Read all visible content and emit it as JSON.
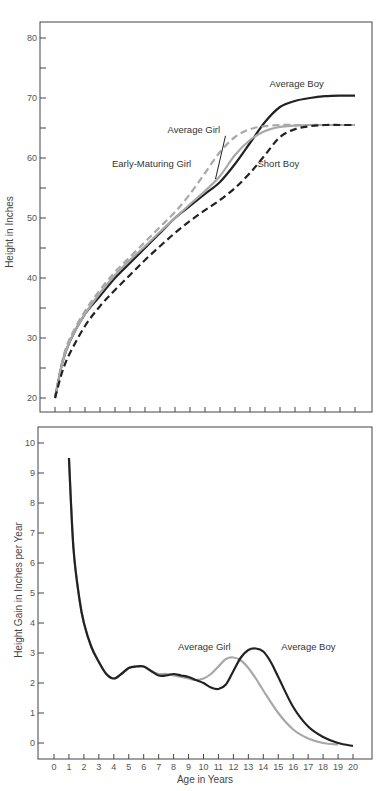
{
  "chart_data": [
    {
      "type": "line",
      "title": "",
      "xlabel": "",
      "ylabel": "Height in Inches",
      "xlim": [
        0,
        20
      ],
      "ylim": [
        20,
        80
      ],
      "yticks": [
        20,
        30,
        40,
        50,
        60,
        70,
        80
      ],
      "x_minor_ticks": [
        0,
        1,
        2,
        3,
        4,
        5,
        6,
        7,
        8,
        9,
        10,
        11,
        12,
        13,
        14,
        15,
        16,
        17,
        18,
        19,
        20
      ],
      "grid": false,
      "colors": {
        "dark": "#222222",
        "gray": "#a8a8a8",
        "axis": "#444444"
      },
      "series": [
        {
          "name": "Average Boy",
          "style": "solid-dark",
          "x": [
            0,
            0.5,
            1,
            2,
            3,
            4,
            5,
            6,
            7,
            8,
            9,
            10,
            11,
            12,
            13,
            14,
            15,
            16,
            17,
            18,
            19,
            20
          ],
          "y": [
            20,
            26,
            29.5,
            34,
            37,
            40,
            42.5,
            45,
            47.5,
            50,
            52,
            54,
            56,
            59,
            62.5,
            66,
            68.5,
            69.5,
            70,
            70.3,
            70.4,
            70.4
          ]
        },
        {
          "name": "Average Girl",
          "style": "solid-gray",
          "x": [
            0,
            0.5,
            1,
            2,
            3,
            4,
            5,
            6,
            7,
            8,
            9,
            10,
            11,
            12,
            13,
            14,
            15,
            16,
            17,
            18,
            19,
            20
          ],
          "y": [
            20,
            26,
            29.5,
            34,
            37.5,
            40.5,
            43,
            45.3,
            47.7,
            50,
            52.3,
            54.5,
            57,
            60.5,
            63,
            64.5,
            65.2,
            65.4,
            65.5,
            65.5,
            65.5,
            65.5
          ]
        },
        {
          "name": "Early-Maturing Girl",
          "style": "dashed-gray",
          "x": [
            0,
            0.5,
            1,
            2,
            3,
            4,
            5,
            6,
            7,
            8,
            9,
            10,
            11,
            12,
            13,
            14,
            15,
            16,
            17,
            18,
            19,
            20
          ],
          "y": [
            20,
            26.3,
            30,
            34.5,
            38,
            41,
            43.5,
            46,
            48.5,
            51,
            54,
            57.5,
            61,
            63.5,
            64.8,
            65.3,
            65.5,
            65.5,
            65.5,
            65.5,
            65.5,
            65.5
          ]
        },
        {
          "name": "Short Boy",
          "style": "dashed-dark",
          "x": [
            0,
            0.5,
            1,
            2,
            3,
            4,
            5,
            6,
            7,
            8,
            9,
            10,
            11,
            12,
            13,
            14,
            15,
            16,
            17,
            18,
            19,
            20
          ],
          "y": [
            20,
            24.5,
            27.5,
            32,
            35.3,
            38,
            40.5,
            43,
            45.3,
            47.5,
            49.5,
            51.3,
            53,
            55,
            57.5,
            60.5,
            63.5,
            64.8,
            65.3,
            65.5,
            65.5,
            65.5
          ]
        }
      ],
      "annotations": [
        {
          "text": "Average Boy",
          "x": 14.3,
          "y": 71.8
        },
        {
          "text": "Average Girl",
          "x": 7.5,
          "y": 64.2,
          "leader_to": [
            10.7,
            56.5
          ]
        },
        {
          "text": "Early-Maturing Girl",
          "x": 3.8,
          "y": 58.5
        },
        {
          "text": "Short Boy",
          "x": 13.5,
          "y": 58.5
        }
      ]
    },
    {
      "type": "line",
      "title": "",
      "xlabel": "Age in Years",
      "ylabel": "Height Gain in Inches per Year",
      "xlim": [
        -0.5,
        20.5
      ],
      "ylim": [
        -0.5,
        10.5
      ],
      "xticks": [
        0,
        1,
        2,
        3,
        4,
        5,
        6,
        7,
        8,
        9,
        10,
        11,
        12,
        13,
        14,
        15,
        16,
        17,
        18,
        19,
        20
      ],
      "yticks": [
        0,
        1,
        2,
        3,
        4,
        5,
        6,
        7,
        8,
        9,
        10
      ],
      "grid": false,
      "colors": {
        "dark": "#222222",
        "gray": "#a8a8a8",
        "axis": "#444444"
      },
      "series": [
        {
          "name": "Average Girl",
          "style": "solid-gray",
          "x": [
            1,
            1.3,
            1.7,
            2,
            2.5,
            3,
            3.5,
            4,
            4.5,
            5,
            5.5,
            6,
            6.5,
            7,
            7.5,
            8,
            8.5,
            9,
            9.5,
            10,
            10.5,
            11,
            11.5,
            12,
            12.5,
            13,
            13.5,
            14,
            15,
            16,
            17,
            18,
            19
          ],
          "y": [
            9.5,
            6.5,
            4.8,
            4.0,
            3.2,
            2.7,
            2.3,
            2.15,
            2.3,
            2.5,
            2.55,
            2.55,
            2.4,
            2.3,
            2.3,
            2.25,
            2.2,
            2.15,
            2.1,
            2.15,
            2.3,
            2.55,
            2.8,
            2.85,
            2.75,
            2.5,
            2.15,
            1.75,
            1.0,
            0.45,
            0.15,
            0.0,
            -0.05
          ]
        },
        {
          "name": "Average Boy",
          "style": "solid-dark",
          "x": [
            1,
            1.3,
            1.7,
            2,
            2.5,
            3,
            3.5,
            4,
            4.5,
            5,
            5.5,
            6,
            6.5,
            7,
            7.5,
            8,
            8.5,
            9,
            9.5,
            10,
            10.5,
            11,
            11.5,
            12,
            12.5,
            13,
            13.5,
            14,
            14.5,
            15,
            16,
            17,
            18,
            19,
            20
          ],
          "y": [
            9.5,
            6.5,
            4.8,
            4.0,
            3.2,
            2.7,
            2.3,
            2.15,
            2.3,
            2.5,
            2.55,
            2.55,
            2.4,
            2.25,
            2.25,
            2.3,
            2.25,
            2.2,
            2.1,
            2.0,
            1.85,
            1.8,
            1.95,
            2.4,
            2.85,
            3.1,
            3.15,
            3.05,
            2.7,
            2.2,
            1.2,
            0.55,
            0.2,
            0.0,
            -0.1
          ]
        }
      ],
      "annotations": [
        {
          "text": "Average Girl",
          "x": 8.3,
          "y": 3.1
        },
        {
          "text": "Average Boy",
          "x": 15.2,
          "y": 3.1
        }
      ]
    }
  ]
}
